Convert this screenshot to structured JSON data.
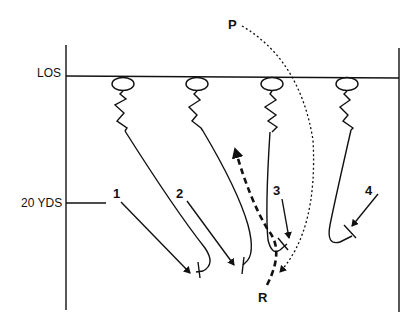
{
  "diagram": {
    "labels": {
      "line_of_scrimmage": "LOS",
      "depth_marker": "20 YDS",
      "passer": "P",
      "receiver": "R",
      "defenders": [
        "1",
        "2",
        "3",
        "4"
      ]
    },
    "colors": {
      "ink": "#111111",
      "background": "#ffffff"
    },
    "elements": {
      "boundaries": [
        "left-sideline",
        "right-sideline"
      ],
      "los_line": true,
      "depth_tick": "20 YDS",
      "defender_count": 4,
      "defender_symbol": "ellipse",
      "defender_movement": "zigzag backpedal then curved drop",
      "pass_path": "dotted arc from P to near R",
      "receiver_route": "thick dashed arrow from R upfield",
      "pursuit_arrows": 4
    }
  }
}
